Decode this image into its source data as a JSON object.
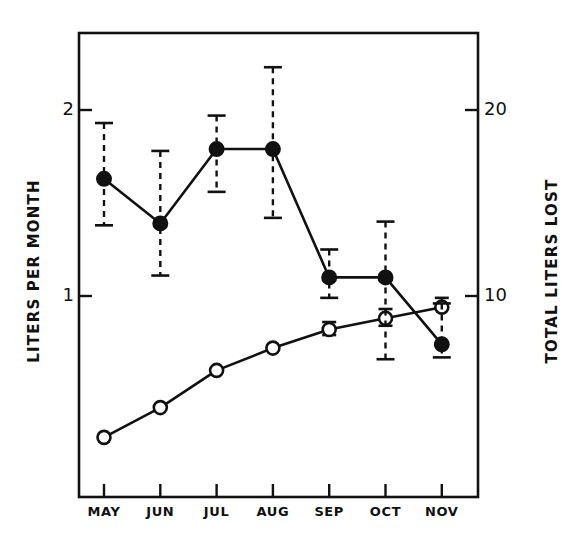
{
  "chart_data": {
    "type": "line",
    "title": "",
    "xlabel": "",
    "ylabel": "LITERS PER MONTH",
    "y2label": "TOTAL LITERS LOST",
    "categories": [
      "MAY",
      "JUN",
      "JUL",
      "AUG",
      "SEP",
      "OCT",
      "NOV"
    ],
    "ylim": [
      0.22,
      2.37
    ],
    "y2lim": [
      2.2,
      23.7
    ],
    "yticks": [
      "1",
      "2"
    ],
    "ytick_values": [
      1,
      2
    ],
    "y2ticks": [
      "10",
      "20"
    ],
    "y2tick_values": [
      10,
      20
    ],
    "grid": false,
    "legend": "none",
    "series": [
      {
        "name": "Liters per month",
        "marker": "filled-circle",
        "axis": "left",
        "linestyle": "solid",
        "errorbar": "dashed",
        "values": [
          1.63,
          1.39,
          1.79,
          1.79,
          1.1,
          1.1,
          0.74
        ],
        "err_upper": [
          1.93,
          1.78,
          1.97,
          2.23,
          1.25,
          1.4,
          0.96
        ],
        "err_lower": [
          1.38,
          1.11,
          1.56,
          1.42,
          0.99,
          0.66,
          0.67
        ]
      },
      {
        "name": "Total liters lost",
        "marker": "open-circle",
        "axis": "right",
        "linestyle": "solid",
        "errorbar": "dashed",
        "values": [
          2.4,
          4.0,
          6.0,
          7.2,
          8.2,
          8.8,
          9.4
        ],
        "err_upper": [
          null,
          null,
          null,
          null,
          8.6,
          9.3,
          9.9
        ],
        "err_lower": [
          null,
          null,
          null,
          null,
          7.9,
          8.4,
          null
        ]
      }
    ]
  },
  "axes": {
    "left_title": "LITERS PER MONTH",
    "right_title": "TOTAL LITERS LOST",
    "left_ticks": [
      {
        "label": "2",
        "value": 2
      },
      {
        "label": "1",
        "value": 1
      }
    ],
    "right_ticks": [
      {
        "label": "20",
        "value": 20
      },
      {
        "label": "10",
        "value": 10
      }
    ],
    "months": [
      "MAY",
      "JUN",
      "JUL",
      "AUG",
      "SEP",
      "OCT",
      "NOV"
    ]
  },
  "colors": {
    "ink": "#111111",
    "background": "#ffffff",
    "marker_fill": "#111111",
    "marker_open": "#ffffff"
  }
}
